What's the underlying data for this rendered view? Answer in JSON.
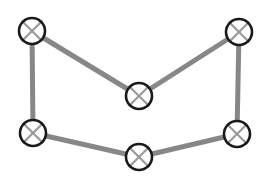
{
  "figure": {
    "title": "",
    "background_color": "#ffffff",
    "width": 273,
    "height": 185
  },
  "style": {
    "edge_color": "#878787",
    "edge_width": 5,
    "node_outline_color": "#1a1a1a",
    "node_outline_width": 2.6,
    "node_fill_color": "#ffffff",
    "node_cross_color": "#9a9a9a",
    "node_cross_width": 2.2,
    "node_radius": 13
  },
  "chart_data": {
    "type": "diagram",
    "subtype": "node-link-graph",
    "title": "",
    "node_glyph": "circle-with-x",
    "node_count": 6,
    "edge_count": 6,
    "nodes": [
      {
        "id": "n1",
        "label": "",
        "name": "node-top-left",
        "x": 32,
        "y": 31
      },
      {
        "id": "n2",
        "label": "",
        "name": "node-top-middle",
        "x": 139,
        "y": 96
      },
      {
        "id": "n3",
        "label": "",
        "name": "node-top-right",
        "x": 239,
        "y": 32
      },
      {
        "id": "n4",
        "label": "",
        "name": "node-bottom-left",
        "x": 33,
        "y": 133
      },
      {
        "id": "n5",
        "label": "",
        "name": "node-bottom-middle",
        "x": 139,
        "y": 157
      },
      {
        "id": "n6",
        "label": "",
        "name": "node-bottom-right",
        "x": 237,
        "y": 134
      }
    ],
    "edges": [
      {
        "id": "e1",
        "from": "n1",
        "to": "n2",
        "name": "edge-top-left-to-top-middle"
      },
      {
        "id": "e2",
        "from": "n2",
        "to": "n3",
        "name": "edge-top-middle-to-top-right"
      },
      {
        "id": "e3",
        "from": "n1",
        "to": "n4",
        "name": "edge-top-left-to-bottom-left"
      },
      {
        "id": "e4",
        "from": "n3",
        "to": "n6",
        "name": "edge-top-right-to-bottom-right"
      },
      {
        "id": "e5",
        "from": "n4",
        "to": "n5",
        "name": "edge-bottom-left-to-bottom-middle"
      },
      {
        "id": "e6",
        "from": "n5",
        "to": "n6",
        "name": "edge-bottom-middle-to-bottom-right"
      }
    ],
    "legend": [],
    "annotations": [],
    "axis": {
      "shown": false
    },
    "grid": false
  }
}
